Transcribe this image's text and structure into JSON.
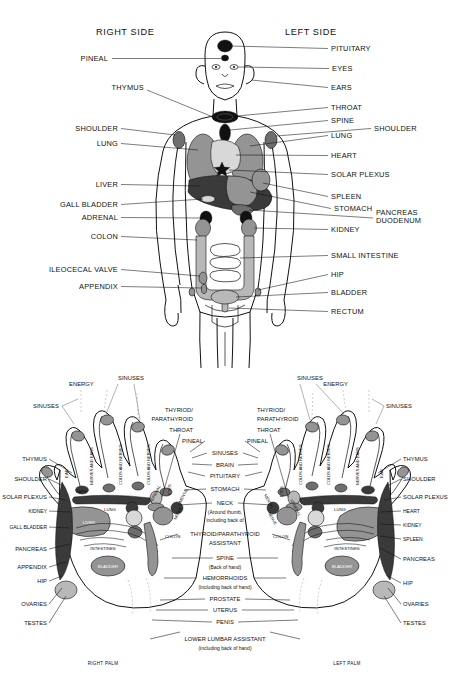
{
  "chart_title": "Reflexology Chart - Body Organs and Hand Reflex Points",
  "body_diagram": {
    "heading_left": "RIGHT SIDE",
    "heading_right": "LEFT SIDE",
    "labels_left": [
      {
        "id": "pineal",
        "text": "PINEAL"
      },
      {
        "id": "thymus",
        "text": "THYMUS"
      },
      {
        "id": "shoulder",
        "text": "SHOULDER"
      },
      {
        "id": "lung",
        "text": "LUNG"
      },
      {
        "id": "liver",
        "text": "LIVER"
      },
      {
        "id": "gall-bladder",
        "text": "GALL BLADDER"
      },
      {
        "id": "adrenal",
        "text": "ADRENAL"
      },
      {
        "id": "colon",
        "text": "COLON"
      },
      {
        "id": "ileocecal-valve",
        "text": "ILEOCECAL VALVE"
      },
      {
        "id": "appendix",
        "text": "APPENDIX"
      }
    ],
    "labels_right": [
      {
        "id": "pituitary",
        "text": "PITUITARY"
      },
      {
        "id": "eyes",
        "text": "EYES"
      },
      {
        "id": "ears",
        "text": "EARS"
      },
      {
        "id": "throat",
        "text": "THROAT"
      },
      {
        "id": "spine",
        "text": "SPINE"
      },
      {
        "id": "shoulder",
        "text": "SHOULDER"
      },
      {
        "id": "lung",
        "text": "LUNG"
      },
      {
        "id": "heart",
        "text": "HEART"
      },
      {
        "id": "solar-plexus",
        "text": "SOLAR PLEXUS"
      },
      {
        "id": "spleen",
        "text": "SPLEEN"
      },
      {
        "id": "stomach",
        "text": "STOMACH"
      },
      {
        "id": "pancreas",
        "text": "PANCREAS"
      },
      {
        "id": "duodenum",
        "text": "DUODENUM"
      },
      {
        "id": "kidney",
        "text": "KIDNEY"
      },
      {
        "id": "small-intestine",
        "text": "SMALL INTESTINE"
      },
      {
        "id": "hip",
        "text": "HIP"
      },
      {
        "id": "bladder",
        "text": "BLADDER"
      },
      {
        "id": "rectum",
        "text": "RECTUM"
      }
    ]
  },
  "hand_diagram": {
    "caption_left": "RIGHT PALM",
    "caption_right": "LEFT PALM",
    "top_labels": {
      "energy": "ENERGY",
      "sinuses": "SINUSES"
    },
    "finger_labels_right_palm": [
      "EAR",
      "NERVES AND EARS",
      "COLDS AND NERVES",
      "COLDS AND NERVES",
      "EYES"
    ],
    "finger_labels_left_palm": [
      "COLDS AND NERVES",
      "COLDS AND NERVES",
      "NERVES AND EARS",
      "EAR",
      "EYES"
    ],
    "fingertip_labels_right": [
      "EARS"
    ],
    "thumb_labels_right": [
      "PINEAL",
      "MENTAL",
      "NERVE",
      "ADRENAL"
    ],
    "thumb_labels_left": [
      "PINEAL",
      "MENTAL",
      "NERVE",
      "ADRENAL"
    ],
    "palm_inner_labels_right": [
      "LUNG",
      "LIVER",
      "INTESTINES",
      "BLADDER",
      "COLON"
    ],
    "palm_inner_labels_left": [
      "LUNG",
      "INTESTINES",
      "BLADDER",
      "COLON"
    ],
    "labels_left_outer": [
      {
        "id": "thymus",
        "text": "THYMUS"
      },
      {
        "id": "shoulder",
        "text": "SHOULDER"
      },
      {
        "id": "solar-plexus",
        "text": "SOLAR PLEXUS"
      },
      {
        "id": "kidney",
        "text": "KIDNEY"
      },
      {
        "id": "gall-bladder",
        "text": "GALL BLADDER"
      },
      {
        "id": "pancreas",
        "text": "PANCREAS"
      },
      {
        "id": "appendix",
        "text": "APPENDIX"
      },
      {
        "id": "hip",
        "text": "HIP"
      },
      {
        "id": "ovaries",
        "text": "OVARIES"
      },
      {
        "id": "testes",
        "text": "TESTES"
      }
    ],
    "labels_right_outer": [
      {
        "id": "thymus",
        "text": "THYMUS"
      },
      {
        "id": "shoulder",
        "text": "SHOULDER"
      },
      {
        "id": "solar-plexus",
        "text": "SOLAR PLEXUS"
      },
      {
        "id": "heart",
        "text": "HEART"
      },
      {
        "id": "kidney",
        "text": "KIDNEY"
      },
      {
        "id": "spleen",
        "text": "SPLEEN"
      },
      {
        "id": "pancreas",
        "text": "PANCREAS"
      },
      {
        "id": "hip",
        "text": "HIP"
      },
      {
        "id": "ovaries",
        "text": "OVARIES"
      },
      {
        "id": "testes",
        "text": "TESTES"
      }
    ],
    "labels_center": [
      {
        "id": "sinuses",
        "text": "SINUSES"
      },
      {
        "id": "brain",
        "text": "BRAIN"
      },
      {
        "id": "pituitary",
        "text": "PITUITARY"
      },
      {
        "id": "stomach",
        "text": "STOMACH"
      },
      {
        "id": "neck",
        "text": "NECK"
      },
      {
        "id": "neck-sub1",
        "text": "(Around thumb,"
      },
      {
        "id": "neck-sub2",
        "text": "including back of"
      },
      {
        "id": "thyroid-assistant-1",
        "text": "THYROID/PARATHYROID"
      },
      {
        "id": "thyroid-assistant-2",
        "text": "ASSISTANT"
      },
      {
        "id": "spine",
        "text": "SPINE"
      },
      {
        "id": "spine-sub",
        "text": "(Back of hand)"
      },
      {
        "id": "hemorrhoids",
        "text": "HEMORRHOIDS"
      },
      {
        "id": "hemorrhoids-sub",
        "text": "(including back of  hand)"
      },
      {
        "id": "prostate",
        "text": "PROSTATE"
      },
      {
        "id": "uterus",
        "text": "UTERUS"
      },
      {
        "id": "penis",
        "text": "PENIS"
      },
      {
        "id": "lower-lumbar",
        "text": "LOWER LUMBAR ASSISTANT"
      },
      {
        "id": "lower-lumbar-sub",
        "text": "(including back of  hand)"
      }
    ],
    "thyroid_block_left": [
      "THYRIOD/",
      "PARATHYROID",
      "THROAT"
    ],
    "thyroid_block_right": [
      "THYRIOD/",
      "PARATHYROID",
      "THROAT"
    ]
  },
  "colors": {
    "ink": "#111111",
    "organ_light": "#d8d8d8",
    "organ_mid": "#b8b8b8",
    "organ_gray": "#949494",
    "organ_dark": "#6e6e6e",
    "organ_black": "#111111",
    "background": "#ffffff"
  }
}
